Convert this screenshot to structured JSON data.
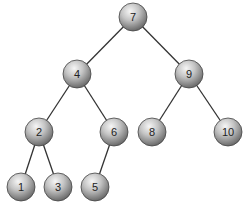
{
  "diagram": {
    "type": "binary-search-tree",
    "nodes": [
      {
        "id": "n7",
        "label": "7",
        "x": 133,
        "y": 17
      },
      {
        "id": "n4",
        "label": "4",
        "x": 77,
        "y": 74
      },
      {
        "id": "n9",
        "label": "9",
        "x": 189,
        "y": 74
      },
      {
        "id": "n2",
        "label": "2",
        "x": 39,
        "y": 132
      },
      {
        "id": "n6",
        "label": "6",
        "x": 114,
        "y": 132
      },
      {
        "id": "n8",
        "label": "8",
        "x": 152,
        "y": 132
      },
      {
        "id": "n10",
        "label": "10",
        "x": 228,
        "y": 132
      },
      {
        "id": "n1",
        "label": "1",
        "x": 21,
        "y": 187
      },
      {
        "id": "n3",
        "label": "3",
        "x": 58,
        "y": 187
      },
      {
        "id": "n5",
        "label": "5",
        "x": 95,
        "y": 187
      }
    ],
    "edges": [
      [
        "n7",
        "n4"
      ],
      [
        "n7",
        "n9"
      ],
      [
        "n4",
        "n2"
      ],
      [
        "n4",
        "n6"
      ],
      [
        "n9",
        "n8"
      ],
      [
        "n9",
        "n10"
      ],
      [
        "n2",
        "n1"
      ],
      [
        "n2",
        "n3"
      ],
      [
        "n6",
        "n5"
      ]
    ],
    "colors": {
      "edge": "#333333",
      "node_highlight": "#f4f4f4",
      "node_mid": "#b8b8b8",
      "node_shadow": "#6e6e6e",
      "node_outline": "#444444"
    }
  }
}
